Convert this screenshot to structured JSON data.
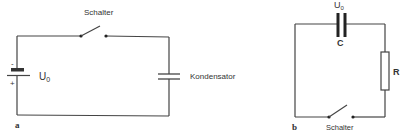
{
  "diagram_a": {
    "figure_label": "a",
    "switch_label": "Schalter",
    "voltage_label": "U",
    "voltage_subscript": "0",
    "battery_minus": "-",
    "battery_plus": "+",
    "capacitor_label": "Kondensator"
  },
  "diagram_b": {
    "figure_label": "b",
    "voltage_label": "U",
    "voltage_subscript": "0",
    "capacitor_label": "C",
    "resistor_label": "R",
    "switch_label": "Schalter"
  },
  "colors": {
    "line": "#444444",
    "text": "#333333",
    "background": "#ffffff"
  }
}
